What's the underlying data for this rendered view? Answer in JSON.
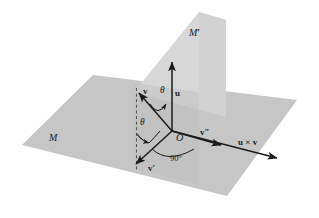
{
  "figure": {
    "background_color": "#ffffff",
    "plane_fill_horizontal": "#c6c6c6",
    "plane_fill_vertical": "#d7d7d7",
    "plane_fill_overlap": "#b9b9b9",
    "stroke_color": "#1a1a1a"
  },
  "planes": [
    {
      "id": "plane-m",
      "label": "M",
      "orientation": "horizontal",
      "fill": "#c6c6c6"
    },
    {
      "id": "plane-m-prime",
      "label": "M",
      "prime": "′",
      "orientation": "vertical",
      "fill": "#d7d7d7"
    }
  ],
  "labels": {
    "plane_m": "M",
    "plane_m_prime": "M",
    "plane_m_prime_mark": "′",
    "vector_v": "v",
    "vector_u": "u",
    "vector_v_prime": "v",
    "vector_v_prime_mark": "′",
    "vector_v_dprime": "v",
    "vector_v_dprime_mark": "″",
    "vector_cross": "u × v",
    "origin": "O",
    "theta_upper": "θ",
    "theta_lower": "θ",
    "right_angle": "90°"
  },
  "vectors": [
    {
      "name": "u",
      "label": "u",
      "direction": "vertical-up",
      "from": "O"
    },
    {
      "name": "v",
      "label": "v",
      "direction": "upper-left",
      "from": "O"
    },
    {
      "name": "v-prime",
      "label": "v′",
      "direction": "lower-left",
      "from": "O"
    },
    {
      "name": "v-double-prime",
      "label": "v″",
      "direction": "right",
      "from": "O"
    },
    {
      "name": "u-cross-v",
      "label": "u × v",
      "direction": "right",
      "from": "O"
    }
  ],
  "angles": [
    {
      "name": "theta-between-v-and-u",
      "value": "θ"
    },
    {
      "name": "theta-between-axis-and-v-prime",
      "value": "θ"
    },
    {
      "name": "right-angle-v-dprime",
      "value": "90°"
    }
  ]
}
